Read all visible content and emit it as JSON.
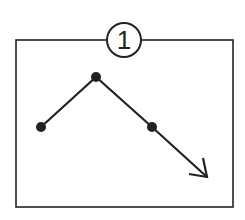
{
  "diagram": {
    "label": "1",
    "colors": {
      "stroke": "#222222",
      "background": "#ffffff"
    },
    "frame": {
      "x": 16,
      "y": 40,
      "width": 217,
      "height": 167
    },
    "badge": {
      "cx": 124,
      "cy": 40,
      "r": 17
    },
    "points": [
      {
        "x": 41,
        "y": 127
      },
      {
        "x": 96,
        "y": 77
      },
      {
        "x": 152,
        "y": 127
      }
    ],
    "arrow": {
      "x1": 152,
      "y1": 127,
      "x2": 207,
      "y2": 177
    }
  }
}
